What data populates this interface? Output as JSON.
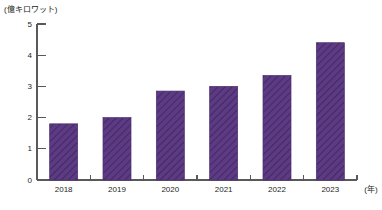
{
  "chart_data": {
    "type": "bar",
    "title": "",
    "subtitle": "",
    "categories": [
      "2018",
      "2019",
      "2020",
      "2021",
      "2022",
      "2023"
    ],
    "values": [
      1.8,
      2.0,
      2.85,
      3.0,
      3.35,
      4.4
    ],
    "series": [
      {
        "name": "",
        "values": [
          1.8,
          2.0,
          2.85,
          3.0,
          3.35,
          4.4
        ]
      }
    ],
    "xlabel": "(年)",
    "ylabel": "(億キロワット)",
    "ylim": [
      0,
      5
    ],
    "yticks": [
      "0",
      "1",
      "2",
      "3",
      "4",
      "5"
    ],
    "ytick_values": [
      0,
      1,
      2,
      3,
      4,
      5
    ],
    "grid": false,
    "legend": false,
    "legend_position": "none",
    "bar_color": "#5c3a84",
    "bar_edge_color": "#4a2f6e",
    "bar_hatch": "diagonal-stripes",
    "axis_color": "#58595b"
  },
  "axes": {
    "unit_label": "(億キロワット)",
    "x_axis_name": "(年)"
  }
}
